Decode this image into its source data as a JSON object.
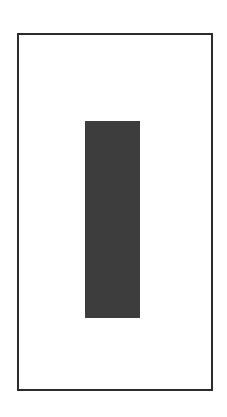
{
  "diagram": {
    "frame": {
      "border_color": "#2b2b2b",
      "fill": "#ffffff"
    },
    "block": {
      "fill": "#3d3d3d"
    }
  }
}
